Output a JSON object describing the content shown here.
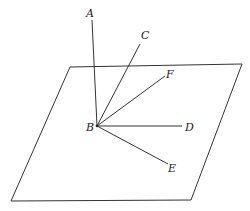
{
  "diagram": {
    "plane": {
      "points": [
        [
          70,
          67
        ],
        [
          242,
          64
        ],
        [
          191,
          200
        ],
        [
          11,
          201
        ]
      ]
    },
    "point_B": [
      97,
      126
    ],
    "rays": [
      {
        "name": "A",
        "end": [
          92,
          20
        ],
        "label_pos": [
          86,
          17
        ]
      },
      {
        "name": "C",
        "end": [
          140,
          44
        ],
        "label_pos": [
          141,
          38
        ]
      },
      {
        "name": "F",
        "end": [
          165,
          76
        ],
        "label_pos": [
          166,
          76
        ]
      },
      {
        "name": "D",
        "end": [
          182,
          126
        ],
        "label_pos": [
          186,
          130
        ]
      },
      {
        "name": "E",
        "end": [
          168,
          164
        ],
        "label_pos": [
          170,
          171
        ]
      }
    ],
    "labels": {
      "A": "A",
      "B": "B",
      "C": "C",
      "D": "D",
      "E": "E",
      "F": "F"
    }
  }
}
